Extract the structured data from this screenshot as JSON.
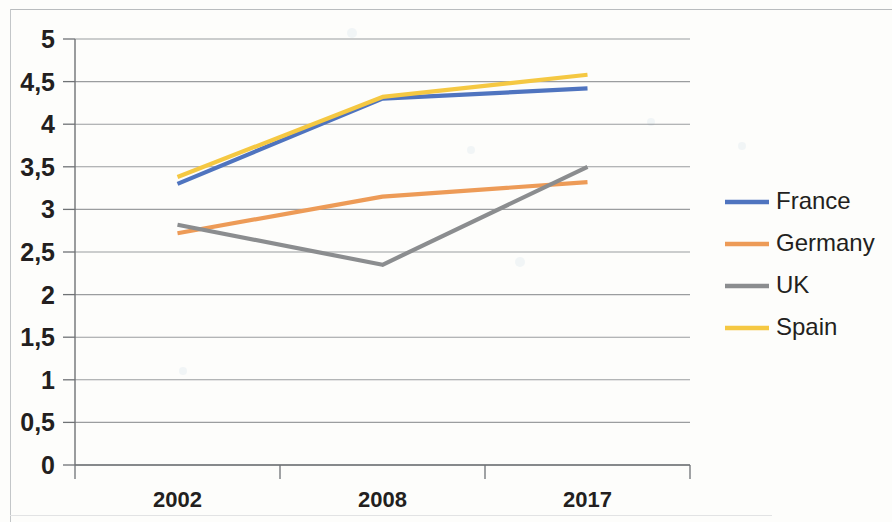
{
  "chart_data": {
    "type": "line",
    "title": "",
    "subtitle": "",
    "xlabel": "",
    "ylabel": "",
    "categories": [
      "2002",
      "2008",
      "2017"
    ],
    "ylim": [
      0,
      5
    ],
    "ytick_labels": [
      "0",
      "0,5",
      "1",
      "1,5",
      "2",
      "2,5",
      "3",
      "3,5",
      "4",
      "4,5",
      "5"
    ],
    "ytick_values": [
      0,
      0.5,
      1,
      1.5,
      2,
      2.5,
      3,
      3.5,
      4,
      4.5,
      5
    ],
    "grid": true,
    "legend_position": "right",
    "decimal_separator": ",",
    "series": [
      {
        "name": "France",
        "color": "#4f74bf",
        "values": [
          3.3,
          4.3,
          4.42
        ]
      },
      {
        "name": "Germany",
        "color": "#ed9b57",
        "values": [
          2.72,
          3.15,
          3.32
        ]
      },
      {
        "name": "UK",
        "color": "#8b8d8f",
        "values": [
          2.82,
          2.35,
          3.5
        ]
      },
      {
        "name": "Spain",
        "color": "#f5c842",
        "values": [
          3.38,
          4.32,
          4.58
        ]
      }
    ]
  },
  "axes": {
    "y": {
      "labels": [
        "5",
        "4,5",
        "4",
        "3,5",
        "3",
        "2,5",
        "2",
        "1,5",
        "1",
        "0,5",
        "0"
      ]
    },
    "x": {
      "labels": [
        "2002",
        "2008",
        "2017"
      ]
    }
  },
  "legend": {
    "items": [
      {
        "label": "France",
        "color": "#4f74bf"
      },
      {
        "label": "Germany",
        "color": "#ed9b57"
      },
      {
        "label": "UK",
        "color": "#8b8d8f"
      },
      {
        "label": "Spain",
        "color": "#f5c842"
      }
    ]
  },
  "style": {
    "grid_color": "#8a8d90",
    "axis_color": "#6f7275",
    "text_color": "#231f20",
    "background": "#fdfdfb"
  }
}
